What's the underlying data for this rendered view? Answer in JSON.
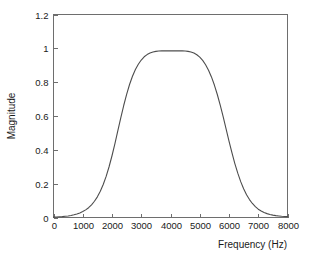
{
  "chart_data": {
    "type": "line",
    "title": "",
    "xlabel": "Frequency (Hz)",
    "ylabel": "Magnitude",
    "xlim": [
      0,
      8000
    ],
    "ylim": [
      0,
      1.2
    ],
    "grid": false,
    "legend": null,
    "x_ticks": [
      0,
      1000,
      2000,
      3000,
      4000,
      5000,
      6000,
      7000,
      8000
    ],
    "x_tick_labels": [
      "0",
      "1000",
      "2000",
      "3000",
      "4000",
      "5000",
      "6000",
      "7000",
      "8000"
    ],
    "y_ticks": [
      0,
      0.2,
      0.4,
      0.6,
      0.8,
      1,
      1.2
    ],
    "y_tick_labels": [
      "0",
      "0.2",
      "0.4",
      "0.6",
      "0.8",
      "1",
      "1.2"
    ],
    "series": [
      {
        "name": "Magnitude response",
        "color": "#4d4d4d",
        "x": [
          0,
          100,
          200,
          300,
          400,
          500,
          600,
          700,
          800,
          900,
          1000,
          1100,
          1200,
          1300,
          1400,
          1500,
          1600,
          1700,
          1800,
          1900,
          2000,
          2100,
          2200,
          2300,
          2400,
          2500,
          2600,
          2700,
          2800,
          2900,
          3000,
          3100,
          3200,
          3300,
          3400,
          3500,
          3600,
          3700,
          3800,
          3900,
          4000,
          4100,
          4200,
          4300,
          4400,
          4500,
          4600,
          4700,
          4800,
          4900,
          5000,
          5100,
          5200,
          5300,
          5400,
          5500,
          5600,
          5700,
          5800,
          5900,
          6000,
          6100,
          6200,
          6300,
          6400,
          6500,
          6600,
          6700,
          6800,
          6900,
          7000,
          7100,
          7200,
          7300,
          7400,
          7500,
          7600,
          7700,
          7800,
          7900,
          8000
        ],
        "y": [
          0.002,
          0.003,
          0.004,
          0.005,
          0.007,
          0.009,
          0.012,
          0.016,
          0.021,
          0.027,
          0.035,
          0.045,
          0.058,
          0.075,
          0.096,
          0.122,
          0.155,
          0.195,
          0.243,
          0.3,
          0.365,
          0.437,
          0.513,
          0.589,
          0.662,
          0.728,
          0.786,
          0.835,
          0.875,
          0.906,
          0.931,
          0.95,
          0.963,
          0.972,
          0.978,
          0.982,
          0.984,
          0.985,
          0.985,
          0.985,
          0.985,
          0.985,
          0.985,
          0.985,
          0.985,
          0.984,
          0.982,
          0.978,
          0.972,
          0.962,
          0.948,
          0.929,
          0.903,
          0.871,
          0.831,
          0.783,
          0.727,
          0.664,
          0.596,
          0.524,
          0.452,
          0.383,
          0.319,
          0.262,
          0.212,
          0.17,
          0.135,
          0.106,
          0.083,
          0.064,
          0.049,
          0.038,
          0.029,
          0.023,
          0.018,
          0.014,
          0.011,
          0.009,
          0.007,
          0.006,
          0.005
        ]
      }
    ],
    "annotations": {
      "peak_magnitude": 0.985,
      "passband_start_hz": 3100,
      "passband_end_hz": 4600,
      "half_power_low_hz": 2000,
      "half_power_high_hz": 5450
    }
  },
  "axes": {
    "x_title": "Frequency (Hz)",
    "y_title": "Magnitude"
  }
}
